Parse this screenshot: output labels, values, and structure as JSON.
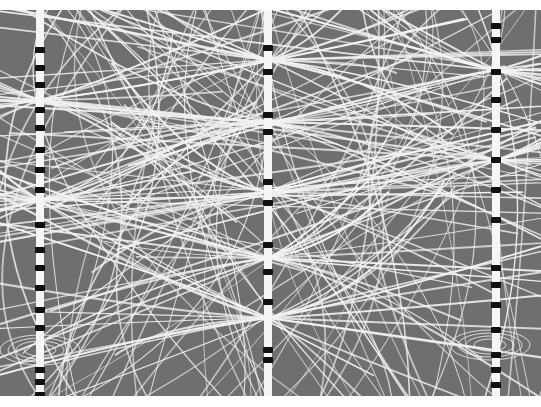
{
  "image": {
    "subject": "field-lines photograph",
    "description": "Grey background crossed by many thin white curved lines, with three vertical beaded conductors at left, center and right; lines converge toward bright nodes along the conductors; small concentric loop patterns near lower left and lower right.",
    "colors": {
      "background": "#6f6f6f",
      "lines": "#f2f2f2",
      "conductor": "#f5f5f5",
      "beads": "#111111",
      "margin": "#ffffff"
    },
    "conductors": [
      {
        "name": "left",
        "x": 40,
        "beads": [
          40,
          58,
          75,
          100,
          118,
          140,
          160,
          180,
          215,
          240,
          258,
          278,
          300,
          318,
          360,
          372,
          385
        ]
      },
      {
        "name": "center",
        "x": 268,
        "beads": [
          38,
          62,
          105,
          122,
          172,
          193,
          235,
          262,
          292,
          340,
          350
        ]
      },
      {
        "name": "right",
        "x": 496,
        "beads": [
          16,
          30,
          62,
          90,
          120,
          150,
          180,
          210,
          258,
          275,
          295,
          320,
          345,
          360,
          375
        ]
      }
    ],
    "nodes": [
      {
        "x": 268,
        "y": 50
      },
      {
        "x": 268,
        "y": 112
      },
      {
        "x": 268,
        "y": 182
      },
      {
        "x": 268,
        "y": 248
      },
      {
        "x": 268,
        "y": 308
      },
      {
        "x": 40,
        "y": 90
      },
      {
        "x": 40,
        "y": 190
      },
      {
        "x": 496,
        "y": 60
      },
      {
        "x": 496,
        "y": 150
      }
    ],
    "loops": [
      {
        "x": 40,
        "y": 340
      },
      {
        "x": 490,
        "y": 335
      }
    ]
  }
}
